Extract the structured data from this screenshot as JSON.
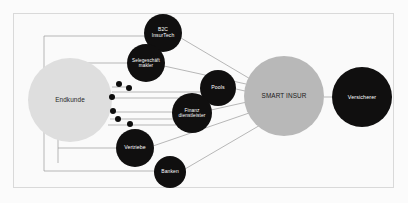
{
  "diagram": {
    "background_color": "#fbfbfb",
    "frame_color": "#d9d9d9",
    "edge_color": "#9a9a9a",
    "colors": {
      "dark_node": "#100f0f",
      "light_grey_node": "#dedede",
      "mid_grey_node": "#b8b8b8",
      "dot": "#0d0d0d"
    },
    "nodes": [
      {
        "id": "endkunde",
        "label": "Endkunde",
        "style": "grey-light",
        "cx": 70,
        "cy": 100,
        "r": 42,
        "font_size": 6.4
      },
      {
        "id": "b2c-insurtech",
        "label": "B2C\nInsurTech",
        "style": "dark",
        "cx": 163,
        "cy": 33,
        "r": 19,
        "font_size": 5.0
      },
      {
        "id": "selegeschaeft-makler",
        "label": "Selegeschäft\nmakler",
        "style": "dark",
        "cx": 146,
        "cy": 63,
        "r": 19,
        "font_size": 4.6
      },
      {
        "id": "pools",
        "label": "Pools",
        "style": "dark",
        "cx": 218,
        "cy": 88,
        "r": 18,
        "font_size": 5.2
      },
      {
        "id": "finanzdienstleister",
        "label": "Finanz\ndienstleister",
        "style": "dark",
        "cx": 192,
        "cy": 113,
        "r": 20,
        "font_size": 4.8
      },
      {
        "id": "vertriebe",
        "label": "Vertriebe",
        "style": "dark",
        "cx": 135,
        "cy": 148,
        "r": 19,
        "font_size": 5.2
      },
      {
        "id": "banken",
        "label": "Banken",
        "style": "dark",
        "cx": 170,
        "cy": 172,
        "r": 16,
        "font_size": 5.0
      },
      {
        "id": "smart-insur",
        "label": "SMART INSUR",
        "style": "grey-mid",
        "cx": 284,
        "cy": 96,
        "r": 40,
        "font_size": 6.4
      },
      {
        "id": "versicherer",
        "label": "Versicherer",
        "style": "dark",
        "cx": 362,
        "cy": 97,
        "r": 30,
        "font_size": 5.4
      }
    ],
    "dots": [
      {
        "cx": 119,
        "cy": 84,
        "r": 3.0
      },
      {
        "cx": 129,
        "cy": 88,
        "r": 3.0
      },
      {
        "cx": 112,
        "cy": 97,
        "r": 3.0
      },
      {
        "cx": 113,
        "cy": 111,
        "r": 3.0
      },
      {
        "cx": 118,
        "cy": 119,
        "r": 3.0
      },
      {
        "cx": 130,
        "cy": 124,
        "r": 3.0
      }
    ],
    "edges": [
      {
        "from": "endkunde",
        "to": "selegeschaeft-makler",
        "kind": "straight",
        "points": "112,87 127,87"
      },
      {
        "from": "endkunde",
        "to": "pools",
        "kind": "straight",
        "points": "112,92 200,92"
      },
      {
        "from": "endkunde",
        "to": "pools",
        "kind": "straight",
        "points": "112,98 200,98"
      },
      {
        "from": "endkunde",
        "to": "finanzdienstleister",
        "kind": "straight",
        "points": "111,112 173,112"
      },
      {
        "from": "endkunde",
        "to": "finanzdienstleister",
        "kind": "straight",
        "points": "110,119 174,119"
      },
      {
        "from": "endkunde",
        "to": "finanzdienstleister",
        "kind": "straight",
        "points": "108,125 176,125"
      },
      {
        "from": "endkunde",
        "to": "b2c-insurtech",
        "kind": "orthogonal",
        "points": "44,171 44,36 145,36"
      },
      {
        "from": "endkunde",
        "to": "selegeschaeft-makler",
        "kind": "orthogonal",
        "points": "58,163 58,63 127,63"
      },
      {
        "from": "endkunde",
        "to": "vertriebe",
        "kind": "orthogonal",
        "points": "58,148 116,148"
      },
      {
        "from": "endkunde",
        "to": "banken",
        "kind": "orthogonal",
        "points": "44,171 155,171"
      },
      {
        "from": "b2c-insurtech",
        "to": "smart-insur",
        "kind": "straight",
        "points": "181,38 252,80"
      },
      {
        "from": "selegeschaeft-makler",
        "to": "smart-insur",
        "kind": "straight",
        "points": "164,66 246,84"
      },
      {
        "from": "pools",
        "to": "smart-insur",
        "kind": "straight",
        "points": "236,89 245,91"
      },
      {
        "from": "finanzdienstleister",
        "to": "smart-insur",
        "kind": "straight",
        "points": "211,110 247,102"
      },
      {
        "from": "vertriebe",
        "to": "smart-insur",
        "kind": "straight",
        "points": "153,146 252,112"
      },
      {
        "from": "banken",
        "to": "smart-insur",
        "kind": "straight",
        "points": "185,169 262,124"
      },
      {
        "from": "smart-insur",
        "to": "versicherer",
        "kind": "straight",
        "points": "324,97 332,97"
      }
    ]
  }
}
